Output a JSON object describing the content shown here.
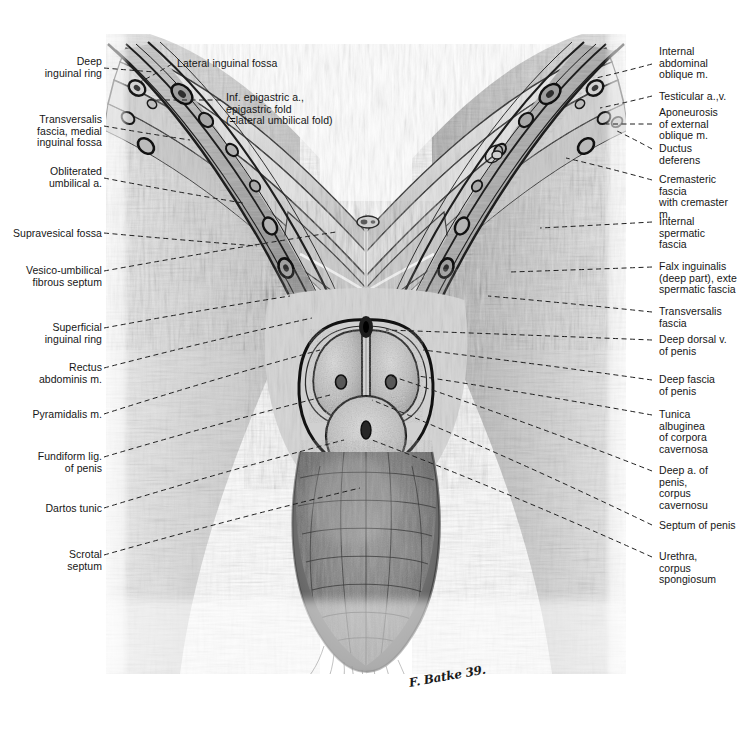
{
  "plate": {
    "title": "Frontal (coronal) section through the male inguinal region, penis and scrotum",
    "signature": "F. Batke 39.",
    "background_color": "#ffffff",
    "ink_color": "#161616"
  },
  "labels_left": [
    {
      "id": "deep-inguinal-ring",
      "text": "Deep\ninguinal ring",
      "x": 16,
      "y": 56,
      "w": 86,
      "tip_x": 155,
      "tip_y": 72,
      "anchor_x": 104,
      "anchor_y": 68
    },
    {
      "id": "transversalis-fascia-medial",
      "text": "Transversalis\nfascia, medial\ninguinal fossa",
      "x": 10,
      "y": 114,
      "w": 92,
      "tip_x": 190,
      "tip_y": 140,
      "anchor_x": 104,
      "anchor_y": 126
    },
    {
      "id": "obliterated-umbilical-a",
      "text": "Obliterated\numbilical a.",
      "x": 16,
      "y": 166,
      "w": 86,
      "tip_x": 243,
      "tip_y": 203,
      "anchor_x": 104,
      "anchor_y": 178
    },
    {
      "id": "supravesical-fossa",
      "text": "Supravesical fossa",
      "x": 6,
      "y": 228,
      "w": 96,
      "tip_x": 257,
      "tip_y": 246,
      "anchor_x": 104,
      "anchor_y": 233
    },
    {
      "id": "vesico-umbilical-septum",
      "text": "Vesico-umbilical\nfibrous septum",
      "x": 10,
      "y": 265,
      "w": 92,
      "tip_x": 336,
      "tip_y": 232,
      "anchor_x": 104,
      "anchor_y": 271
    },
    {
      "id": "superficial-inguinal-ring",
      "text": "Superficial\ninguinal ring",
      "x": 16,
      "y": 322,
      "w": 86,
      "tip_x": 290,
      "tip_y": 296,
      "anchor_x": 104,
      "anchor_y": 328
    },
    {
      "id": "rectus-abdominis-m",
      "text": "Rectus\nabdominis m.",
      "x": 16,
      "y": 362,
      "w": 86,
      "tip_x": 312,
      "tip_y": 318,
      "anchor_x": 104,
      "anchor_y": 368
    },
    {
      "id": "pyramidalis-m",
      "text": "Pyramidalis m.",
      "x": 14,
      "y": 409,
      "w": 88,
      "tip_x": 320,
      "tip_y": 350,
      "anchor_x": 104,
      "anchor_y": 414
    },
    {
      "id": "fundiform-lig-of-penis",
      "text": "Fundiform lig.\nof penis",
      "x": 16,
      "y": 451,
      "w": 86,
      "tip_x": 330,
      "tip_y": 395,
      "anchor_x": 104,
      "anchor_y": 457
    },
    {
      "id": "dartos-tunic",
      "text": "Dartos tunic",
      "x": 14,
      "y": 503,
      "w": 88,
      "tip_x": 344,
      "tip_y": 440,
      "anchor_x": 104,
      "anchor_y": 508
    },
    {
      "id": "scrotal-septum",
      "text": "Scrotal\nseptum",
      "x": 16,
      "y": 549,
      "w": 86,
      "tip_x": 360,
      "tip_y": 488,
      "anchor_x": 104,
      "anchor_y": 555
    }
  ],
  "labels_right": [
    {
      "id": "internal-abdominal-oblique-m",
      "text": "Internal\nabdominal\noblique m.",
      "x": 659,
      "y": 46,
      "w": 76,
      "tip_x": 596,
      "tip_y": 78,
      "anchor_x": 652,
      "anchor_y": 64
    },
    {
      "id": "testicular-a-v",
      "text": "Testicular a.,v.",
      "x": 659,
      "y": 91,
      "w": 76,
      "tip_x": 600,
      "tip_y": 108,
      "anchor_x": 652,
      "anchor_y": 96
    },
    {
      "id": "aponeurosis-external-oblique",
      "text": "Aponeurosis\nof external\noblique m.",
      "x": 659,
      "y": 107,
      "w": 76,
      "tip_x": 606,
      "tip_y": 124,
      "anchor_x": 652,
      "anchor_y": 124
    },
    {
      "id": "ductus-deferens",
      "text": "Ductus\ndeferens",
      "x": 659,
      "y": 143,
      "w": 76,
      "tip_x": 617,
      "tip_y": 131,
      "anchor_x": 652,
      "anchor_y": 149
    },
    {
      "id": "cremasteric-fascia",
      "text": "Cremasteric\nfascia\nwith cremaster m.",
      "x": 659,
      "y": 174,
      "w": 80,
      "tip_x": 566,
      "tip_y": 158,
      "anchor_x": 652,
      "anchor_y": 180
    },
    {
      "id": "internal-spermatic-fascia",
      "text": "Internal\nspermatic\nfascia",
      "x": 659,
      "y": 216,
      "w": 76,
      "tip_x": 540,
      "tip_y": 228,
      "anchor_x": 652,
      "anchor_y": 222
    },
    {
      "id": "falx-inguinalis",
      "text": "Falx inguinalis\n(deep part), exte\nspermatic fascia",
      "x": 659,
      "y": 261,
      "w": 78,
      "tip_x": 510,
      "tip_y": 272,
      "anchor_x": 652,
      "anchor_y": 267
    },
    {
      "id": "transversalis-fascia",
      "text": "Transversalis\nfascia",
      "x": 659,
      "y": 306,
      "w": 76,
      "tip_x": 488,
      "tip_y": 296,
      "anchor_x": 652,
      "anchor_y": 312
    },
    {
      "id": "deep-dorsal-v-of-penis",
      "text": "Deep dorsal v.\nof penis",
      "x": 659,
      "y": 334,
      "w": 76,
      "tip_x": 386,
      "tip_y": 330,
      "anchor_x": 652,
      "anchor_y": 340
    },
    {
      "id": "deep-fascia-of-penis",
      "text": "Deep fascia\nof penis",
      "x": 659,
      "y": 374,
      "w": 76,
      "tip_x": 423,
      "tip_y": 350,
      "anchor_x": 652,
      "anchor_y": 380
    },
    {
      "id": "tunica-albuginea",
      "text": "Tunica albuginea\nof corpora\ncavernosa",
      "x": 659,
      "y": 409,
      "w": 78,
      "tip_x": 418,
      "tip_y": 376,
      "anchor_x": 652,
      "anchor_y": 415
    },
    {
      "id": "deep-a-of-penis",
      "text": "Deep a. of penis,\ncorpus cavernosu",
      "x": 659,
      "y": 465,
      "w": 78,
      "tip_x": 391,
      "tip_y": 376,
      "anchor_x": 652,
      "anchor_y": 471
    },
    {
      "id": "septum-of-penis",
      "text": "Septum of penis",
      "x": 659,
      "y": 520,
      "w": 78,
      "tip_x": 372,
      "tip_y": 400,
      "anchor_x": 652,
      "anchor_y": 525
    },
    {
      "id": "urethra-corpus-spongiosum",
      "text": "Urethra,\ncorpus\nspongiosum",
      "x": 659,
      "y": 551,
      "w": 76,
      "tip_x": 372,
      "tip_y": 440,
      "anchor_x": 652,
      "anchor_y": 557
    }
  ],
  "labels_center": [
    {
      "id": "lateral-inguinal-fossa",
      "text": "Lateral inguinal fossa",
      "x": 177,
      "y": 58,
      "w": 150,
      "tip_x": 140,
      "tip_y": 82,
      "anchor_x": 172,
      "anchor_y": 64
    },
    {
      "id": "inf-epigastric-a",
      "text": "Inf. epigastric a.,\nepigastric fold\n(=lateral umbilical fold)",
      "x": 226,
      "y": 92,
      "w": 150,
      "tip_x": 150,
      "tip_y": 100,
      "anchor_x": 221,
      "anchor_y": 100
    }
  ]
}
